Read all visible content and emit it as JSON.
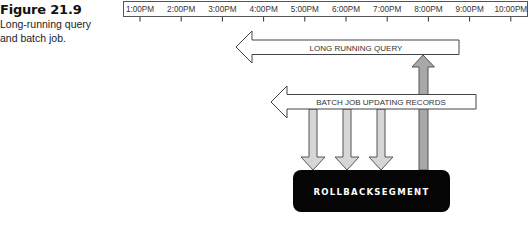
{
  "caption": {
    "figure_number": "Figure 21.9",
    "line1": "Long-running query",
    "line2": "and batch job."
  },
  "timeline": {
    "labels": [
      "1:00PM",
      "2:00PM",
      "3:00PM",
      "4:00PM",
      "5:00PM",
      "6:00PM",
      "7:00PM",
      "8:00PM",
      "9:00PM",
      "10:00PM"
    ]
  },
  "arrows": {
    "long_query": {
      "label": "LONG RUNNING QUERY",
      "direction": "left",
      "fill": "#ffffff"
    },
    "batch_job": {
      "label": "BATCH JOB UPDATING RECORDS",
      "direction": "left",
      "fill": "#ffffff"
    },
    "writes": {
      "count": 3,
      "direction": "down",
      "fill": "#d6d6d6"
    },
    "read": {
      "direction": "up",
      "fill": "#a8a8a8"
    }
  },
  "rollback": {
    "label": "ROLLBACKSEGMENT",
    "fill": "#050505"
  }
}
